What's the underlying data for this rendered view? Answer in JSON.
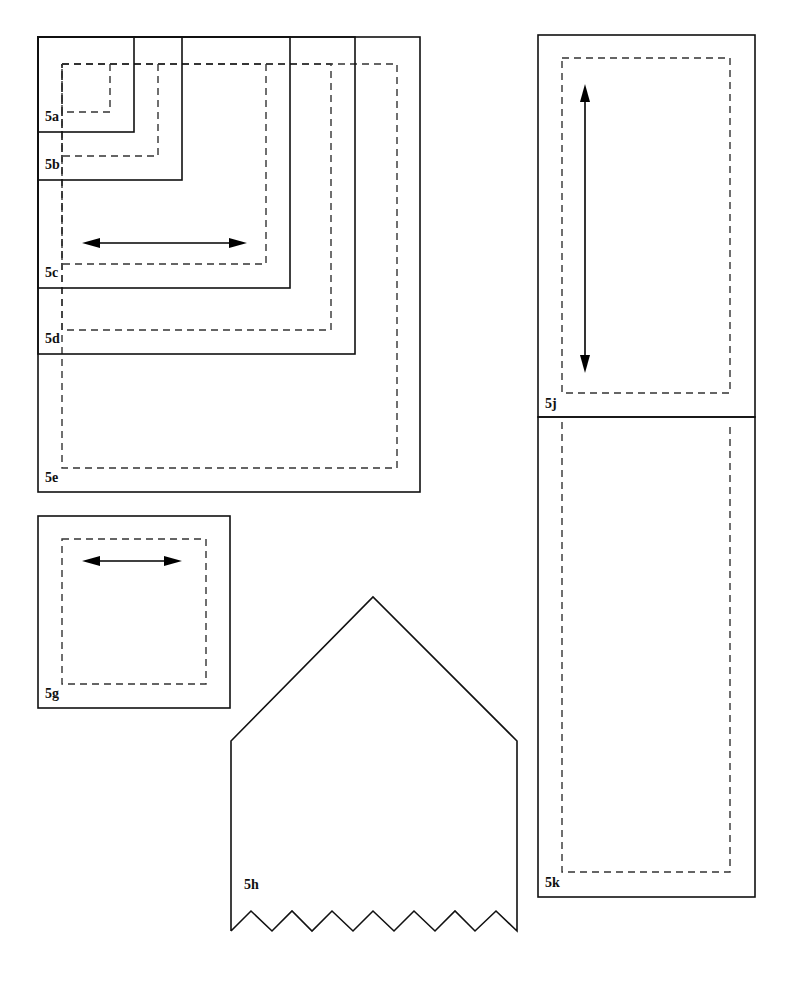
{
  "colors": {
    "line": "#111111",
    "dash": "#333333",
    "background": "#ffffff"
  },
  "pieces": [
    {
      "id": "5a",
      "label": "5a",
      "shape": "rect",
      "outer": [
        38,
        37,
        134,
        132
      ],
      "dashed": [
        62,
        64,
        110,
        112
      ],
      "label_pos": [
        45,
        110
      ]
    },
    {
      "id": "5b",
      "label": "5b",
      "shape": "rect",
      "outer": [
        38,
        37,
        182,
        180
      ],
      "dashed": [
        62,
        64,
        158,
        156
      ],
      "label_pos": [
        45,
        158
      ]
    },
    {
      "id": "5c",
      "label": "5c",
      "shape": "rect",
      "outer": [
        38,
        37,
        290,
        288
      ],
      "dashed": [
        62,
        64,
        266,
        264
      ],
      "label_pos": [
        45,
        266
      ],
      "arrow": {
        "dir": "horizontal",
        "from": [
          82,
          243
        ],
        "to": [
          247,
          243
        ]
      }
    },
    {
      "id": "5d",
      "label": "5d",
      "shape": "rect",
      "outer": [
        38,
        37,
        355,
        354
      ],
      "dashed": [
        62,
        64,
        331,
        330
      ],
      "label_pos": [
        45,
        332
      ]
    },
    {
      "id": "5e",
      "label": "5e",
      "shape": "rect",
      "outer": [
        38,
        37,
        420,
        492
      ],
      "dashed": [
        62,
        64,
        397,
        468
      ],
      "label_pos": [
        45,
        470
      ]
    },
    {
      "id": "5g",
      "label": "5g",
      "shape": "rect",
      "outer": [
        38,
        516,
        230,
        708
      ],
      "dashed": [
        62,
        539,
        206,
        684
      ],
      "label_pos": [
        45,
        686
      ],
      "arrow": {
        "dir": "horizontal",
        "from": [
          82,
          561
        ],
        "to": [
          182,
          561
        ]
      }
    },
    {
      "id": "5h",
      "label": "5h",
      "shape": "house-zigzag",
      "peak": [
        373,
        597
      ],
      "shoulders_y": 741,
      "left_x": 231,
      "right_x": 517,
      "zig_bottom_y": 931,
      "zig_top_y": 911,
      "label_pos": [
        244,
        877
      ]
    },
    {
      "id": "5j",
      "label": "5j",
      "shape": "rect",
      "outer": [
        538,
        35,
        755,
        417
      ],
      "dashed": [
        562,
        58,
        730,
        393
      ],
      "label_pos": [
        545,
        396
      ],
      "arrow": {
        "dir": "vertical",
        "from": [
          585,
          84
        ],
        "to": [
          585,
          373
        ]
      }
    },
    {
      "id": "5k",
      "label": "5k",
      "shape": "rect",
      "outer": [
        538,
        417,
        755,
        897
      ],
      "dashed": [
        562,
        417,
        730,
        872
      ],
      "label_pos": [
        545,
        875
      ]
    }
  ]
}
